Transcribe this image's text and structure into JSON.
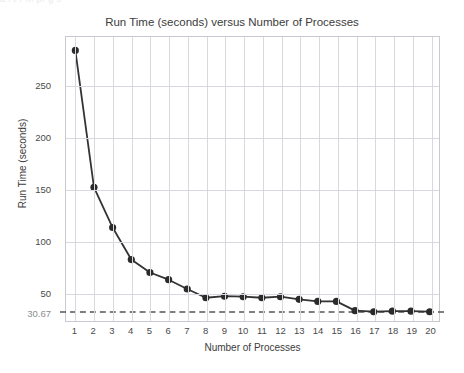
{
  "top_bleed_text": "a  i              t     r   m       pr      g    s",
  "chart_data": {
    "type": "line",
    "title": "Run Time (seconds) versus Number of Processes",
    "xlabel": "Number of Processes",
    "ylabel": "Run Time (seconds)",
    "categories": [
      1,
      2,
      3,
      4,
      5,
      6,
      7,
      8,
      9,
      10,
      11,
      12,
      13,
      14,
      15,
      16,
      17,
      18,
      19,
      20
    ],
    "x": [
      1,
      2,
      3,
      4,
      5,
      6,
      7,
      8,
      9,
      10,
      11,
      12,
      13,
      14,
      15,
      16,
      17,
      18,
      19,
      20
    ],
    "values": [
      284.0,
      151.5,
      112.5,
      81.5,
      69.0,
      62.0,
      53.0,
      44.5,
      46.0,
      45.5,
      44.5,
      45.5,
      43.0,
      41.0,
      41.0,
      32.0,
      31.0,
      31.5,
      31.5,
      31.0
    ],
    "series": [
      {
        "name": "Run Time",
        "values": [
          284.0,
          151.5,
          112.5,
          81.5,
          69.0,
          62.0,
          53.0,
          44.5,
          46.0,
          45.5,
          44.5,
          45.5,
          43.0,
          41.0,
          41.0,
          32.0,
          31.0,
          31.5,
          31.5,
          31.0
        ],
        "color": "#333333",
        "marker": "circle",
        "linestyle": "solid"
      }
    ],
    "xlim": [
      0.5,
      20.5
    ],
    "ylim": [
      22.0,
      297.0
    ],
    "yticks": [
      50,
      100,
      150,
      200,
      250
    ],
    "ytick_labels": [
      "50",
      "100",
      "150",
      "200",
      "250"
    ],
    "xticks": [
      1,
      2,
      3,
      4,
      5,
      6,
      7,
      8,
      9,
      10,
      11,
      12,
      13,
      14,
      15,
      16,
      17,
      18,
      19,
      20
    ],
    "xtick_labels": [
      "1",
      "2",
      "3",
      "4",
      "5",
      "6",
      "7",
      "8",
      "9",
      "10",
      "11",
      "12",
      "13",
      "14",
      "15",
      "16",
      "17",
      "18",
      "19",
      "20"
    ],
    "grid": true,
    "legend": false,
    "annotations": [
      {
        "type": "hline",
        "value": 30.67,
        "label": "30.67",
        "linestyle": "dashed",
        "color": "#555555"
      }
    ],
    "colors": {
      "line": "#333333",
      "marker": "#2b2b2b",
      "grid": "#d8d8de",
      "axis_border": "#c9c9d1",
      "tick_text": "#4a4a4a",
      "annotation_text": "#8c8c92",
      "title_text": "#3c3c3c",
      "background": "#ffffff"
    }
  }
}
